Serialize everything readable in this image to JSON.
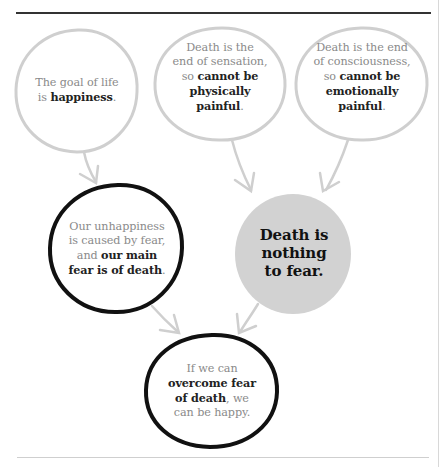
{
  "diagram": {
    "colors": {
      "premise_stroke": "#cfcfcf",
      "key_stroke": "#111111",
      "conclusion_fill": "#d2d2d2",
      "arrow": "#cfcfcf",
      "normal_text": "#8a8a8a",
      "bold_text": "#222222",
      "top_rule": "#333333"
    },
    "nodes": [
      {
        "id": "goal-of-life",
        "style": "premise",
        "parts": [
          {
            "text": "The goal of life",
            "bold": false
          },
          {
            "text": "is ",
            "bold": false
          },
          {
            "text": "happiness",
            "bold": true
          },
          {
            "text": ".",
            "bold": false
          }
        ]
      },
      {
        "id": "end-of-sensation",
        "style": "premise",
        "parts": [
          {
            "text": "Death is the",
            "bold": false
          },
          {
            "text": "end of sensation,",
            "bold": false
          },
          {
            "text": "so ",
            "bold": false
          },
          {
            "text": "cannot be",
            "bold": true
          },
          {
            "text": "physically",
            "bold": true
          },
          {
            "text": "painful",
            "bold": true
          },
          {
            "text": ".",
            "bold": false
          }
        ]
      },
      {
        "id": "end-of-consciousness",
        "style": "premise",
        "parts": [
          {
            "text": "Death is the end",
            "bold": false
          },
          {
            "text": "of consciousness,",
            "bold": false
          },
          {
            "text": "so ",
            "bold": false
          },
          {
            "text": "cannot be",
            "bold": true
          },
          {
            "text": "emotionally",
            "bold": true
          },
          {
            "text": "painful",
            "bold": true
          },
          {
            "text": ".",
            "bold": false
          }
        ]
      },
      {
        "id": "unhappiness-fear",
        "style": "key",
        "parts": [
          {
            "text": "Our unhappiness",
            "bold": false
          },
          {
            "text": "is caused by fear,",
            "bold": false
          },
          {
            "text": "and ",
            "bold": false
          },
          {
            "text": "our main",
            "bold": true
          },
          {
            "text": "fear is of death",
            "bold": true
          },
          {
            "text": ".",
            "bold": false
          }
        ]
      },
      {
        "id": "nothing-to-fear",
        "style": "conclusion",
        "parts": [
          {
            "text": "Death is",
            "bold": true
          },
          {
            "text": "nothing",
            "bold": true
          },
          {
            "text": "to fear.",
            "bold": true
          }
        ]
      },
      {
        "id": "overcome-fear",
        "style": "key",
        "parts": [
          {
            "text": "If we can",
            "bold": false
          },
          {
            "text": "overcome fear",
            "bold": true
          },
          {
            "text": "of death",
            "bold": true
          },
          {
            "text": ", we",
            "bold": false
          },
          {
            "text": "can be happy.",
            "bold": false
          }
        ]
      }
    ],
    "lines": {
      "n1": [
        "The goal of life",
        "is",
        "happiness",
        "."
      ],
      "n2": [
        "Death is the",
        "end of sensation,",
        "so",
        "cannot be",
        "physically",
        "painful",
        "."
      ],
      "n3": [
        "Death is the end",
        "of consciousness,",
        "so",
        "cannot be",
        "emotionally",
        "painful",
        "."
      ],
      "n4": [
        "Our unhappiness",
        "is caused by fear,",
        "and",
        "our main",
        "fear is of death",
        "."
      ],
      "n5": [
        "Death is",
        "nothing",
        "to fear."
      ],
      "n6": [
        "If we can",
        "overcome fear",
        "of death",
        ", we",
        "can be happy."
      ]
    },
    "edges": [
      {
        "from": "goal-of-life",
        "to": "unhappiness-fear"
      },
      {
        "from": "end-of-sensation",
        "to": "nothing-to-fear"
      },
      {
        "from": "end-of-consciousness",
        "to": "nothing-to-fear"
      },
      {
        "from": "unhappiness-fear",
        "to": "overcome-fear"
      },
      {
        "from": "nothing-to-fear",
        "to": "overcome-fear"
      }
    ]
  }
}
